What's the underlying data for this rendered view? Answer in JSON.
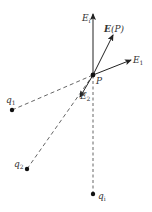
{
  "diagram": {
    "type": "electric-field-superposition",
    "point": {
      "label": "P",
      "x": 93,
      "y": 75
    },
    "vectors": [
      {
        "name": "E_i",
        "label_main": "E",
        "label_sub": "i",
        "to": [
          93,
          14
        ]
      },
      {
        "name": "E(P)",
        "label_main": "E",
        "label_rest": "(P)",
        "to": [
          113,
          35
        ]
      },
      {
        "name": "E_1",
        "label_main": "E",
        "label_sub": "1",
        "to": [
          131,
          60
        ]
      },
      {
        "name": "E_2",
        "label_main": "E",
        "label_sub": "2",
        "to": [
          80,
          97
        ]
      }
    ],
    "charges": [
      {
        "name": "q1",
        "label_main": "q",
        "label_sub": "1",
        "x": 12,
        "y": 110
      },
      {
        "name": "q2",
        "label_main": "q",
        "label_sub": "2",
        "x": 27,
        "y": 169
      },
      {
        "name": "qi",
        "label_main": "q",
        "label_sub": "i",
        "x": 93,
        "y": 194
      }
    ],
    "colors": {
      "line": "#333333",
      "dash": "#555555",
      "background": "#ffffff"
    }
  }
}
